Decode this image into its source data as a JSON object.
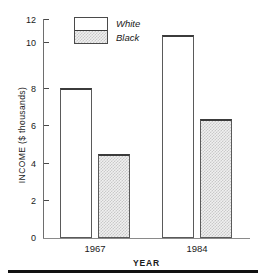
{
  "chart_data": {
    "type": "bar",
    "title": "",
    "xlabel": "YEAR",
    "ylabel": "INCOME ($ thousands)",
    "categories": [
      "1967",
      "1984"
    ],
    "series": [
      {
        "name": "White",
        "values": [
          8.2,
          11.1
        ],
        "style": "open"
      },
      {
        "name": "Black",
        "values": [
          4.6,
          6.5
        ],
        "style": "hatched"
      }
    ],
    "ylim": [
      0,
      12
    ],
    "yticks": [
      0,
      2,
      4,
      6,
      8,
      10,
      12
    ],
    "ytick_labels": [
      "0",
      "2",
      "4",
      "6",
      "8",
      "10",
      "12"
    ],
    "grid": false,
    "legend_position": "top-left",
    "legend_entries": [
      "White",
      "Black"
    ]
  },
  "axes": {
    "y_title": "INCOME ($ thousands)",
    "x_title": "YEAR",
    "y_ticks": [
      "12",
      "10",
      "8",
      "6",
      "4",
      "2",
      "0"
    ],
    "x_ticks": [
      "1967",
      "1984"
    ]
  },
  "legend": {
    "white_label": "White",
    "black_label": "Black"
  },
  "colors": {
    "bar_outline": "#5a5a5a",
    "bar_white_fill": "#ffffff",
    "bar_black_fill": "#e8e8e8",
    "axis": "#6e6e6e",
    "text": "#1a1a1a",
    "rule": "#111111"
  }
}
